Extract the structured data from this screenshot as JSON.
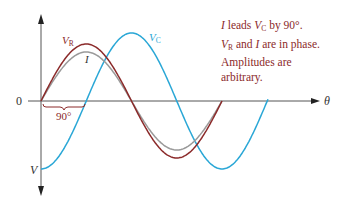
{
  "diagram": {
    "axis": {
      "origin_label": "0",
      "x_axis_label": "θ",
      "y_axis_bottom_label": "V"
    },
    "phase_marker": {
      "label": "90°"
    },
    "curves": [
      {
        "name": "V_R",
        "label_main": "V",
        "label_sub": "R",
        "color": "#8b2a2a",
        "amplitude_px": 57,
        "phase_deg": 0
      },
      {
        "name": "I",
        "label_main": "I",
        "label_sub": "",
        "color": "#9a9a9a",
        "amplitude_px": 49,
        "phase_deg": 0
      },
      {
        "name": "V_C",
        "label_main": "V",
        "label_sub": "C",
        "color": "#2aa7d6",
        "amplitude_px": 68,
        "phase_deg": -90
      }
    ],
    "note": {
      "line1_a": "I",
      "line1_b": " leads ",
      "line1_c": "V",
      "line1_c_sub": "C",
      "line1_d": " by 90°.",
      "line2_a": "V",
      "line2_a_sub": "R",
      "line2_b": " and ",
      "line2_c": "I",
      "line2_d": " are in phase.",
      "line3": "Amplitudes are",
      "line4": "arbitrary."
    }
  }
}
